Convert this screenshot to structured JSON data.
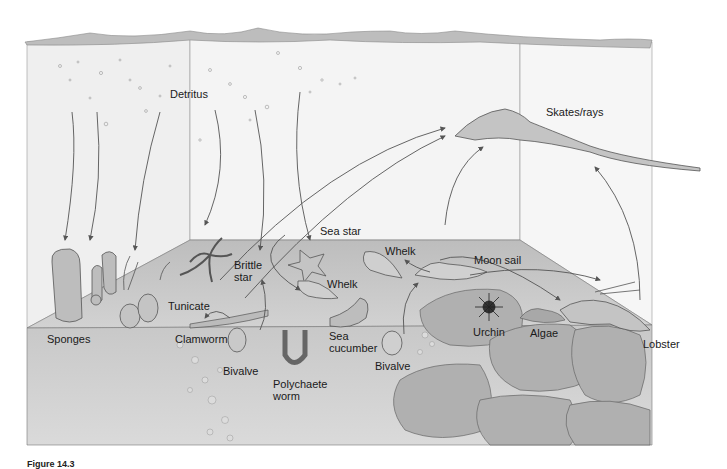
{
  "diagram": {
    "type": "illustrated benthic food web",
    "labels": {
      "detritus": "Detritus",
      "skates_rays": "Skates/rays",
      "sea_star": "Sea star",
      "brittle_star": "Brittle\nstar",
      "whelk_upper": "Whelk",
      "whelk_lower": "Whelk",
      "moon_snail": "Moon sail",
      "tunicate": "Tunicate",
      "sponges": "Sponges",
      "clamworm": "Clamworm",
      "bivalve_left": "Bivalve",
      "polychaete_worm": "Polychaete\nworm",
      "sea_cucumber": "Sea\ncucumber",
      "bivalve_right": "Bivalve",
      "urchin": "Urchin",
      "algae": "Algae",
      "lobster": "Lobster"
    },
    "caption": "Figure 14.3"
  },
  "colors": {
    "water": "#f1f1f1",
    "surface": "#c4c4c4",
    "floor": "#b9b9b9",
    "rock": "#a8a8a8",
    "line": "#555555"
  }
}
